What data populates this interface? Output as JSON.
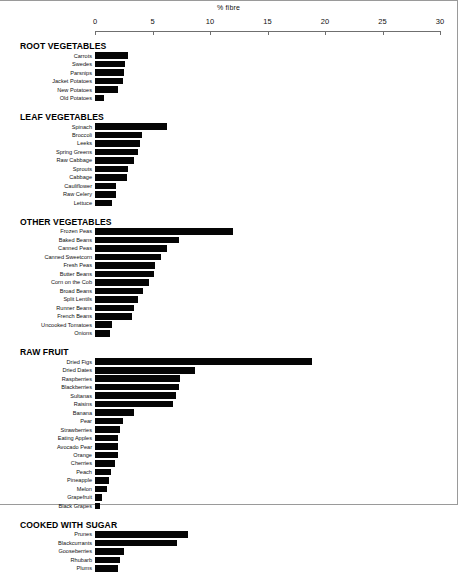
{
  "axis": {
    "title": "% fibre",
    "ticks": [
      0,
      5,
      10,
      15,
      20,
      25,
      30
    ],
    "min": 0,
    "max": 30
  },
  "chart_data": {
    "type": "bar",
    "orientation": "horizontal",
    "title": "% fibre",
    "xlabel": "% fibre",
    "ylabel": "",
    "xlim": [
      0,
      30
    ],
    "grid": false,
    "legend": null,
    "units": "percent fibre by weight",
    "groups": [
      {
        "name": "ROOT VEGETABLES",
        "categories": [
          "Carrots",
          "Swedes",
          "Parsnips",
          "Jacket Potatoes",
          "New Potatoes",
          "Old Potatoes"
        ],
        "values": [
          2.9,
          2.6,
          2.5,
          2.4,
          2.0,
          0.8
        ]
      },
      {
        "name": "LEAF VEGETABLES",
        "categories": [
          "Spinach",
          "Broccoli",
          "Leeks",
          "Spring Greens",
          "Raw Cabbage",
          "Sprouts",
          "Cabbage",
          "Cauliflower",
          "Raw Celery",
          "Lettuce"
        ],
        "values": [
          6.3,
          4.1,
          3.9,
          3.7,
          3.4,
          2.9,
          2.8,
          1.8,
          1.8,
          1.5
        ]
      },
      {
        "name": "OTHER VEGETABLES",
        "categories": [
          "Frozen Peas",
          "Baked Beans",
          "Canned Peas",
          "Canned Sweetcorn",
          "Fresh Peas",
          "Butter Beans",
          "Corn on the Cob",
          "Broad Beans",
          "Split Lentils",
          "Runner Beans",
          "French Beans",
          "Uncooked Tomatoes",
          "Onions"
        ],
        "values": [
          12.0,
          7.3,
          6.3,
          5.7,
          5.2,
          5.1,
          4.7,
          4.2,
          3.7,
          3.4,
          3.2,
          1.5,
          1.3
        ]
      },
      {
        "name": "RAW FRUIT",
        "categories": [
          "Dried Figs",
          "Dried Dates",
          "Raspberries",
          "Blackberries",
          "Sultanas",
          "Raisins",
          "Banana",
          "Pear",
          "Strawberries",
          "Eating Apples",
          "Avocado Pear",
          "Orange",
          "Cherries",
          "Peach",
          "Pineapple",
          "Melon",
          "Grapefruit",
          "Black Grapes"
        ],
        "values": [
          18.9,
          8.7,
          7.4,
          7.3,
          7.0,
          6.8,
          3.4,
          2.4,
          2.2,
          2.0,
          2.0,
          2.0,
          1.7,
          1.4,
          1.2,
          1.0,
          0.6,
          0.4
        ]
      },
      {
        "name": "COOKED WITH SUGAR",
        "categories": [
          "Prunes",
          "Blackcurrants",
          "Gooseberries",
          "Rhubarb",
          "Plums"
        ],
        "values": [
          8.1,
          7.1,
          2.5,
          2.2,
          2.0
        ]
      }
    ]
  }
}
